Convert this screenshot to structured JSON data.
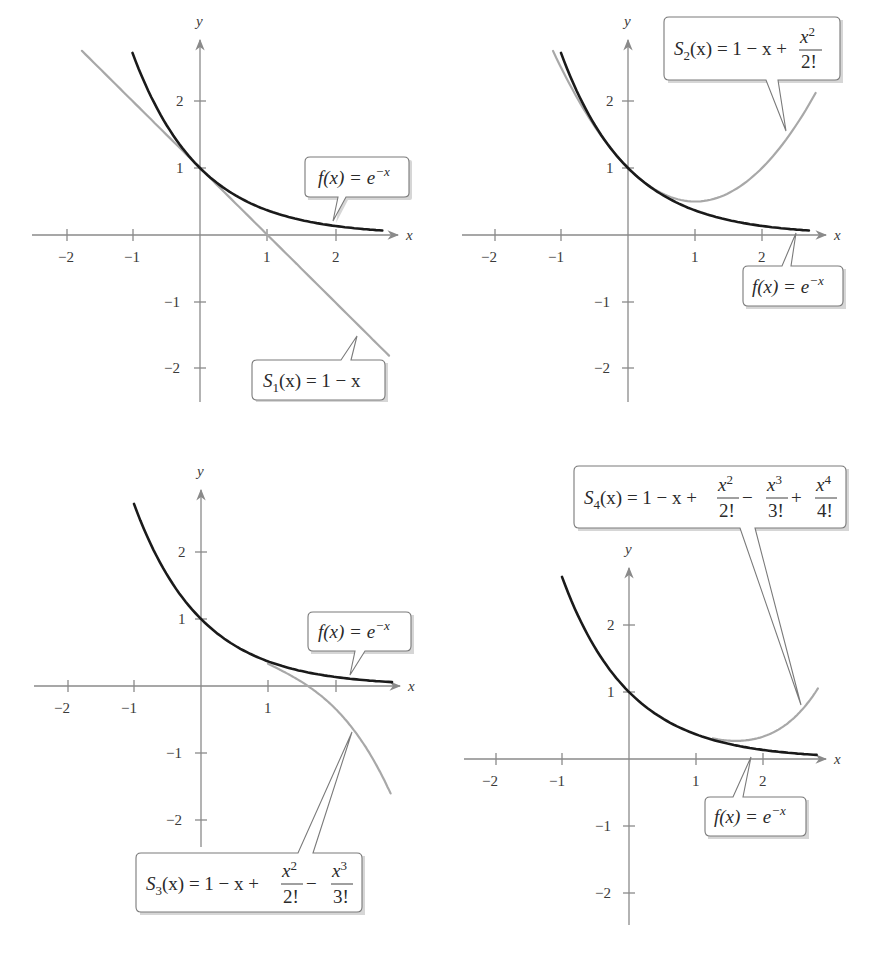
{
  "chart_data": [
    {
      "type": "line",
      "panel": "top-left",
      "xlabel": "x",
      "ylabel": "y",
      "xticks": [
        "−2",
        "−1",
        "1",
        "2"
      ],
      "yticks": [
        "2",
        "1",
        "−1",
        "−2"
      ],
      "xlim": [
        -2.5,
        3
      ],
      "ylim": [
        -2.5,
        2.8
      ],
      "grid": false,
      "series": [
        {
          "name": "f(x) = e^(−x)",
          "color": "#1a1a1a",
          "domain": [
            -1,
            2.7
          ],
          "points": [
            [
              -1,
              2.718
            ],
            [
              0,
              1
            ],
            [
              1,
              0.368
            ],
            [
              2,
              0.135
            ],
            [
              2.7,
              0.067
            ]
          ]
        },
        {
          "name": "S1(x) = 1 − x",
          "color": "#a8a8a8",
          "domain": [
            -1.75,
            2.8
          ],
          "points": [
            [
              -1.75,
              2.75
            ],
            [
              0,
              1
            ],
            [
              1,
              0
            ],
            [
              2.8,
              -1.8
            ]
          ]
        }
      ],
      "annotations": [
        {
          "label_parts": [
            "f(x) = e",
            "−x"
          ],
          "text": "f(x) = e^(−x)"
        },
        {
          "label_parts": [
            "S",
            "1",
            "(x) = 1 − x"
          ],
          "text": "S1(x) = 1 − x"
        }
      ]
    },
    {
      "type": "line",
      "panel": "top-right",
      "xlabel": "x",
      "ylabel": "y",
      "xticks": [
        "−2",
        "−1",
        "1",
        "2"
      ],
      "yticks": [
        "2",
        "1",
        "−1",
        "−2"
      ],
      "xlim": [
        -2.5,
        3
      ],
      "ylim": [
        -2.5,
        2.8
      ],
      "grid": false,
      "series": [
        {
          "name": "f(x) = e^(−x)",
          "color": "#1a1a1a",
          "domain": [
            -1,
            2.7
          ],
          "points": [
            [
              -1,
              2.718
            ],
            [
              0,
              1
            ],
            [
              1,
              0.368
            ],
            [
              2,
              0.135
            ],
            [
              2.7,
              0.067
            ]
          ]
        },
        {
          "name": "S2(x) = 1 − x + x²/2!",
          "color": "#a8a8a8",
          "domain": [
            -1.1,
            2.8
          ],
          "points": [
            [
              -1.1,
              2.705
            ],
            [
              0,
              1
            ],
            [
              1,
              0.5
            ],
            [
              2,
              1
            ],
            [
              2.8,
              2.12
            ]
          ]
        }
      ],
      "annotations": [
        {
          "label_parts": [
            "S",
            "2",
            "(x) = 1 − x + ",
            "x",
            "2",
            "2!"
          ],
          "text": "S2(x) = 1 − x + x²/2!"
        },
        {
          "label_parts": [
            "f(x) = e",
            "−x"
          ],
          "text": "f(x) = e^(−x)"
        }
      ]
    },
    {
      "type": "line",
      "panel": "bottom-left",
      "xlabel": "x",
      "ylabel": "y",
      "xticks": [
        "−2",
        "−1",
        "1",
        ""
      ],
      "yticks": [
        "2",
        "1",
        "−1",
        "−2"
      ],
      "xlim": [
        -2.5,
        3
      ],
      "ylim": [
        -2.5,
        2.8
      ],
      "grid": false,
      "series": [
        {
          "name": "f(x) = e^(−x)",
          "color": "#1a1a1a",
          "domain": [
            -1,
            2.8
          ],
          "points": [
            [
              -1,
              2.718
            ],
            [
              0,
              1
            ],
            [
              1,
              0.368
            ],
            [
              2,
              0.135
            ],
            [
              2.8,
              0.061
            ]
          ]
        },
        {
          "name": "S3(x) = 1 − x + x²/2! − x³/3!",
          "color": "#a8a8a8",
          "domain": [
            1,
            2.8
          ],
          "points": [
            [
              1,
              0.333
            ],
            [
              2,
              -0.333
            ],
            [
              2.8,
              -1.539
            ]
          ]
        }
      ],
      "annotations": [
        {
          "label_parts": [
            "f(x) = e",
            "−x"
          ],
          "text": "f(x) = e^(−x)"
        },
        {
          "label_parts": [
            "S",
            "3",
            "(x) = 1 − x + ",
            "x",
            "2",
            "2!",
            " − ",
            "x",
            "3",
            "3!"
          ],
          "text": "S3(x) = 1 − x + x²/2! − x³/3!"
        }
      ]
    },
    {
      "type": "line",
      "panel": "bottom-right",
      "xlabel": "x",
      "ylabel": "y",
      "xticks": [
        "−2",
        "−1",
        "1",
        "2"
      ],
      "yticks": [
        "2",
        "1",
        "−1",
        "−2"
      ],
      "xlim": [
        -2.5,
        3
      ],
      "ylim": [
        -2.5,
        2.8
      ],
      "grid": false,
      "series": [
        {
          "name": "f(x) = e^(−x)",
          "color": "#1a1a1a",
          "domain": [
            -1,
            2.8
          ],
          "points": [
            [
              -1,
              2.718
            ],
            [
              0,
              1
            ],
            [
              1,
              0.368
            ],
            [
              2,
              0.135
            ],
            [
              2.8,
              0.061
            ]
          ]
        },
        {
          "name": "S4(x) = 1 − x + x²/2! − x³/3! + x⁴/4!",
          "color": "#a8a8a8",
          "domain": [
            1.3,
            2.8
          ],
          "points": [
            [
              1.3,
              0.316
            ],
            [
              2,
              0.333
            ],
            [
              2.8,
              0.99
            ]
          ]
        }
      ],
      "annotations": [
        {
          "label_parts": [
            "S",
            "4",
            "(x) = 1 − x + ",
            "x",
            "2",
            "2!",
            " − ",
            "x",
            "3",
            "3!",
            " + ",
            "x",
            "4",
            "4!"
          ],
          "text": "S4(x) = 1 − x + x²/2! − x³/3! + x⁴/4!"
        },
        {
          "label_parts": [
            "f(x) = e",
            "−x"
          ],
          "text": "f(x) = e^(−x)"
        }
      ]
    }
  ],
  "axis": {
    "x_label": "x",
    "y_label": "y"
  },
  "colors": {
    "f_curve": "#1a1a1a",
    "taylor_curve": "#a8a8a8",
    "axis": "#8a8a8a"
  }
}
